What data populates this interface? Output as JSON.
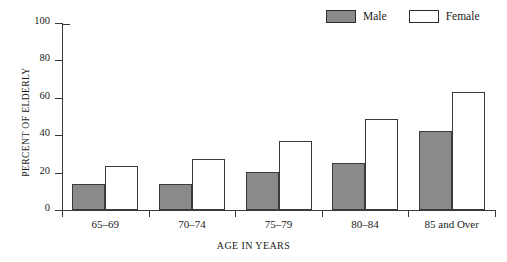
{
  "chart_data": {
    "type": "bar",
    "title": "",
    "subtitle": "",
    "xlabel": "AGE IN YEARS",
    "ylabel": "PERCENT OF ELDERLY",
    "categories": [
      "65–69",
      "70–74",
      "75–79",
      "80–84",
      "85 and Over"
    ],
    "series": [
      {
        "name": "Male",
        "values": [
          14,
          14,
          20.5,
          25,
          42
        ],
        "color": "#8a8a8a"
      },
      {
        "name": "Female",
        "values": [
          23.5,
          27.5,
          37,
          48.5,
          63
        ],
        "color": "#ffffff"
      }
    ],
    "ylim": [
      0,
      100
    ],
    "yticks": [
      0,
      20,
      40,
      60,
      80,
      100
    ],
    "ytick_labels": [
      "0",
      "20",
      "40",
      "60",
      "80",
      "100"
    ],
    "grid": false,
    "legend": {
      "position": "top-right",
      "entries": [
        "Male",
        "Female"
      ]
    }
  },
  "legend": {
    "male_label": "Male",
    "female_label": "Female"
  },
  "axes": {
    "y_title": "PERCENT OF ELDERLY",
    "x_title": "AGE IN YEARS"
  }
}
